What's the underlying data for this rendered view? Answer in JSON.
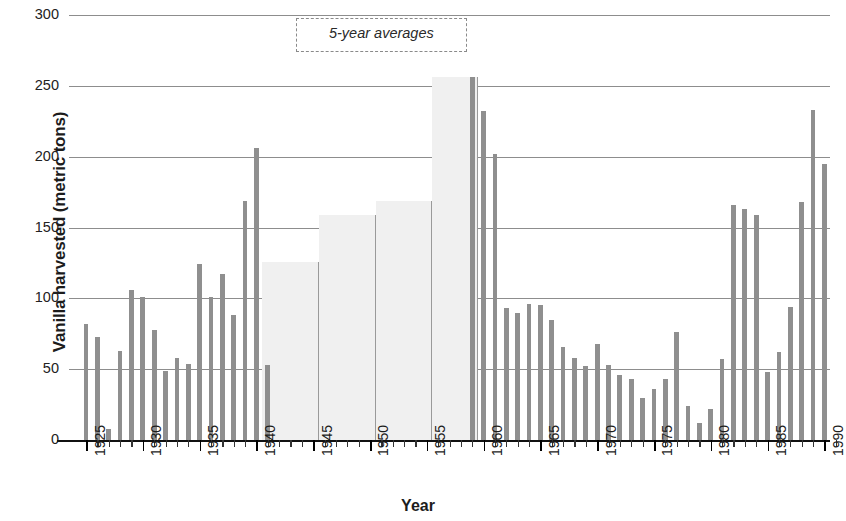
{
  "chart_data": {
    "type": "bar",
    "title": "",
    "subtitle": "",
    "xlabel": "Year",
    "ylabel": "Vanilla harvested (metric tons)",
    "xlim": [
      1924,
      1991
    ],
    "ylim": [
      0,
      300
    ],
    "y_ticks": [
      0,
      50,
      100,
      150,
      200,
      250,
      300
    ],
    "x_ticks": [
      1925,
      1930,
      1935,
      1940,
      1945,
      1950,
      1955,
      1960,
      1965,
      1970,
      1975,
      1980,
      1985,
      1990
    ],
    "x_tick_labels": [
      "1925",
      "1930",
      "1935",
      "1940",
      "1945",
      "1950",
      "1955",
      "1960",
      "1965",
      "1970",
      "1975",
      "1980",
      "1985",
      "1990"
    ],
    "y_tick_labels": [
      "0",
      "50",
      "100",
      "150",
      "200",
      "250",
      "300"
    ],
    "grid": true,
    "grid_axis": "y",
    "legend": false,
    "bar_color": "#8f8f8f",
    "average_bar_color": "#f0f0f0",
    "annotations": [
      {
        "text": "5-year averages",
        "x_start": 1944,
        "x_end": 1959,
        "y": 290,
        "style": "dashed-bracket"
      }
    ],
    "series": [
      {
        "name": "Annual harvest",
        "kind": "annual",
        "x": [
          1925,
          1926,
          1927,
          1928,
          1929,
          1930,
          1931,
          1932,
          1933,
          1934,
          1935,
          1936,
          1937,
          1938,
          1939,
          1940,
          1941,
          1959,
          1960,
          1961,
          1962,
          1963,
          1964,
          1965,
          1966,
          1967,
          1968,
          1969,
          1970,
          1971,
          1972,
          1973,
          1974,
          1975,
          1976,
          1977,
          1978,
          1979,
          1980,
          1981,
          1982,
          1983,
          1984,
          1985,
          1986,
          1987,
          1988,
          1989,
          1990
        ],
        "values": [
          82,
          73,
          8,
          63,
          106,
          101,
          78,
          49,
          58,
          54,
          124,
          101,
          117,
          88,
          169,
          206,
          53,
          256,
          232,
          202,
          93,
          90,
          96,
          95,
          85,
          66,
          58,
          52,
          68,
          53,
          46,
          43,
          30,
          36,
          43,
          76,
          24,
          12,
          22,
          57,
          166,
          163,
          159,
          48,
          62,
          94,
          168,
          233,
          195
        ]
      },
      {
        "name": "5-year averages",
        "kind": "average",
        "periods": [
          {
            "label": "1941-1945",
            "x_start": 1941,
            "x_end": 1946,
            "value": 126
          },
          {
            "label": "1946-1950",
            "x_start": 1946,
            "x_end": 1951,
            "value": 159
          },
          {
            "label": "1951-1955",
            "x_start": 1951,
            "x_end": 1956,
            "value": 169
          },
          {
            "label": "1956-1959",
            "x_start": 1956,
            "x_end": 1960,
            "value": 256
          }
        ]
      }
    ]
  }
}
